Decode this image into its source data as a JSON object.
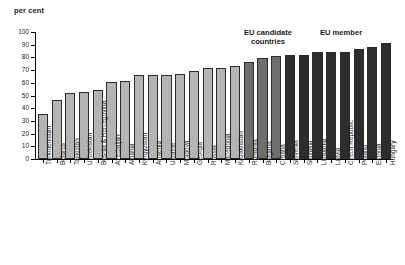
{
  "chart_data": {
    "type": "bar",
    "title": "",
    "subtitle": "",
    "xlabel": "",
    "ylabel": "per cent",
    "ylim": [
      0,
      100
    ],
    "ytick_step": 10,
    "yticks": [
      100,
      90,
      80,
      70,
      60,
      50,
      40,
      30,
      20,
      10,
      0
    ],
    "grid": false,
    "legend_position": "none",
    "orientation": "vertical",
    "categories": [
      "Turkmenistan",
      "Belarus",
      "Tajikistan",
      "Uzbekistan",
      "Bosnia & Hercegovina",
      "Azerbaijan",
      "Albania",
      "Kyrgyzstan",
      "Armenia",
      "Ukraine",
      "Moldova",
      "Georgia",
      "Russia",
      "Macedonia",
      "Kazakhstan",
      "Romania",
      "Bulgaria",
      "Croatia",
      "Slovenia",
      "Slovakia",
      "Lithuania",
      "Latvia",
      "Czech Republic",
      "Poland",
      "Estonia",
      "Hungary"
    ],
    "values": [
      35.5,
      46.5,
      52,
      53,
      54.5,
      60.5,
      61.5,
      66,
      66,
      66.5,
      67,
      69.5,
      71.5,
      71.5,
      73,
      76.5,
      79.5,
      81,
      82,
      82,
      84,
      84.5,
      84.5,
      86.5,
      88,
      91.5
    ],
    "groups": [
      "other",
      "other",
      "other",
      "other",
      "other",
      "other",
      "other",
      "other",
      "other",
      "other",
      "other",
      "other",
      "other",
      "other",
      "other",
      "candidate",
      "candidate",
      "candidate",
      "member",
      "member",
      "member",
      "member",
      "member",
      "member",
      "member",
      "member"
    ],
    "annotations": [
      {
        "id": "candidate",
        "text": "EU candidate\ncountries"
      },
      {
        "id": "member",
        "text": "EU member"
      }
    ],
    "colors": {
      "other": "#b4b4b4",
      "candidate": "#6e6e6e",
      "member": "#2d2d2d",
      "axis": "#000000",
      "background": "#ffffff"
    }
  }
}
